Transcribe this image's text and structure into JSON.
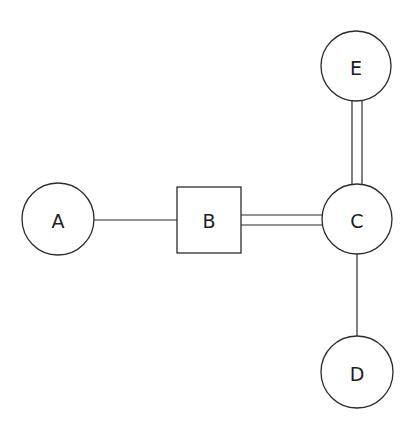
{
  "diagram": {
    "type": "graph",
    "stroke_color": "#2b2b2b",
    "background": "#ffffff",
    "nodes": [
      {
        "id": "A",
        "label": "A",
        "shape": "circle",
        "cx": 58,
        "cy": 219,
        "r": 36
      },
      {
        "id": "B",
        "label": "B",
        "shape": "square",
        "x": 177,
        "y": 187,
        "w": 64,
        "h": 66
      },
      {
        "id": "C",
        "label": "C",
        "shape": "circle",
        "cx": 357,
        "cy": 219,
        "r": 35
      },
      {
        "id": "E",
        "label": "E",
        "shape": "circle",
        "cx": 356,
        "cy": 66,
        "r": 35
      },
      {
        "id": "D",
        "label": "D",
        "shape": "circle",
        "cx": 357,
        "cy": 372,
        "r": 36
      }
    ],
    "edges": [
      {
        "from": "A",
        "to": "B",
        "style": "single"
      },
      {
        "from": "B",
        "to": "C",
        "style": "double"
      },
      {
        "from": "C",
        "to": "E",
        "style": "double"
      },
      {
        "from": "C",
        "to": "D",
        "style": "single"
      }
    ]
  }
}
